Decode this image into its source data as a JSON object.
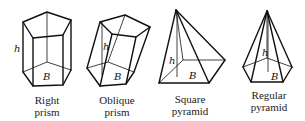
{
  "figures": [
    {
      "id": "right-prism",
      "caption": [
        "Right",
        "prism"
      ],
      "height_label": "h",
      "base_label": "B"
    },
    {
      "id": "oblique-prism",
      "caption": [
        "Oblique",
        "prism"
      ],
      "height_label": "h",
      "base_label": "B"
    },
    {
      "id": "square-pyramid",
      "caption": [
        "Square",
        "pyramid"
      ],
      "height_label": "h",
      "base_label": "B"
    },
    {
      "id": "regular-pyramid",
      "caption": [
        "Regular",
        "pyramid"
      ],
      "height_label": "h",
      "base_label": "B"
    }
  ]
}
